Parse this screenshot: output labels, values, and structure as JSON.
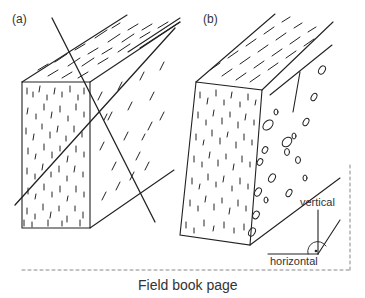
{
  "figure": {
    "panels": [
      {
        "id": "a",
        "label": "(a)"
      },
      {
        "id": "b",
        "label": "(b)"
      }
    ],
    "inset": {
      "vertical_label": "vertical",
      "horizontal_label": "horizontal"
    },
    "caption": "Field book page",
    "colors": {
      "line": "#222222",
      "dashed_border": "#888888",
      "text": "#333333",
      "background": "#ffffff"
    }
  }
}
